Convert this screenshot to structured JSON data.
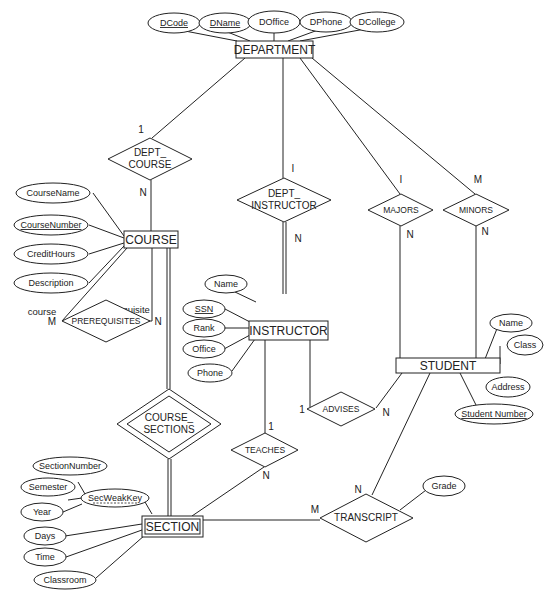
{
  "diagram": {
    "type": "ER diagram",
    "entities": {
      "department": "DEPARTMENT",
      "course": "COURSE",
      "instructor": "INSTRUCTOR",
      "student": "STUDENT",
      "section": "SECTION"
    },
    "relationships": {
      "dept_course": [
        "DEPT_",
        "COURSE"
      ],
      "dept_instructor": [
        "DEPT_",
        "INSTRUCTOR"
      ],
      "majors": "MAJORS",
      "minors": "MINORS",
      "prerequisites": "PREREQUISITES",
      "course_sections": [
        "COURSE_",
        "SECTIONS"
      ],
      "teaches": "TEACHES",
      "advises": "ADVISES",
      "transcript": "TRANSCRIPT"
    },
    "attributes": {
      "department": [
        "DCode",
        "DName",
        "DOffice",
        "DPhone",
        "DCollege"
      ],
      "course": [
        "CourseName",
        "CourseNumber",
        "CreditHours",
        "Description"
      ],
      "instructor": [
        "Name",
        "SSN",
        "Rank",
        "Office",
        "Phone"
      ],
      "student": [
        "Name",
        "Class",
        "Address",
        "Student Number"
      ],
      "section": [
        "SectionNumber",
        "Semester",
        "SecWeakKey",
        "Year",
        "Days",
        "Time",
        "Classroom"
      ],
      "transcript": [
        "Grade"
      ]
    },
    "roles": {
      "course": "course",
      "prerequisite": "prerequisite"
    },
    "cardinalities": {
      "dept_course_dept": "1",
      "dept_course_course": "N",
      "dept_instr_dept": "I",
      "dept_instr_instr": "N",
      "majors_dept": "I",
      "majors_student": "N",
      "minors_dept": "M",
      "minors_student": "N",
      "prereq_course": "M",
      "prereq_prereq": "N",
      "advises_instr": "1",
      "advises_student": "N",
      "teaches_instr": "1",
      "teaches_section": "N",
      "transcript_student": "N",
      "transcript_section": "M"
    }
  }
}
